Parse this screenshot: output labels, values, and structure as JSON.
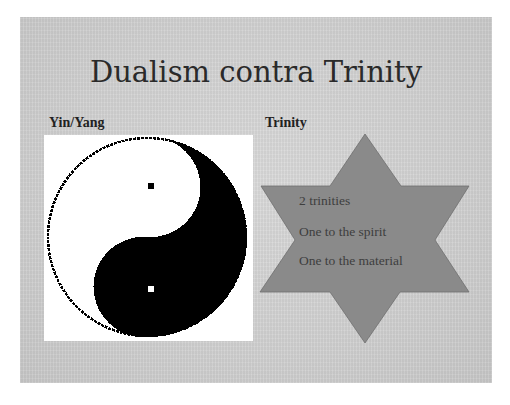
{
  "slide": {
    "title": "Dualism contra Trinity",
    "left_label": "Yin/Yang",
    "right_label": "Trinity",
    "yin_yang_icon": "yin-yang-icon",
    "star_icon": "six-pointed-star-icon",
    "star_lines": [
      "2 trinities",
      "One to the spirit",
      "One to the material"
    ],
    "colors": {
      "slide_background": "#d4d4d4",
      "star_fill": "#8a8a8a",
      "star_text": "#3e3e3e",
      "title_text": "#2a2a2a"
    }
  }
}
